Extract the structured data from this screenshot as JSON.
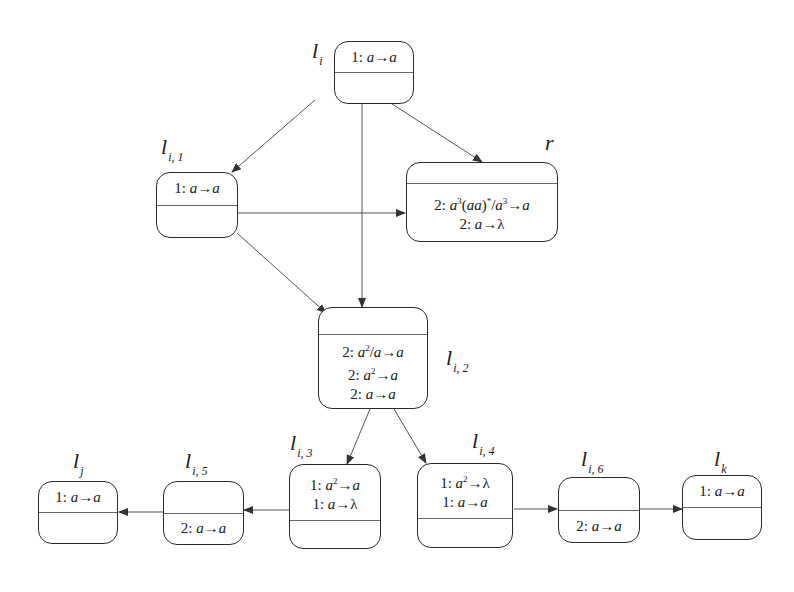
{
  "diagram": {
    "type": "state-transition",
    "nodes": [
      {
        "id": "li",
        "label": "l",
        "sub": "i",
        "top_rules": [
          "1: a→a"
        ],
        "bottom_rules": []
      },
      {
        "id": "li1",
        "label": "l",
        "sub": "i, 1",
        "top_rules": [
          "1: a→a"
        ],
        "bottom_rules": []
      },
      {
        "id": "r",
        "label": "r",
        "sub": "",
        "top_rules": [],
        "bottom_rules": [
          "2: a^3(aa)*/a^3→a",
          "2: a→λ"
        ]
      },
      {
        "id": "li2",
        "label": "l",
        "sub": "i, 2",
        "top_rules": [],
        "bottom_rules": [
          "2: a^2/a→a",
          "2: a^2→a",
          "2: a→a"
        ]
      },
      {
        "id": "li3",
        "label": "l",
        "sub": "i, 3",
        "top_rules": [
          "1: a^2→a",
          "1: a→λ"
        ],
        "bottom_rules": []
      },
      {
        "id": "li4",
        "label": "l",
        "sub": "i, 4",
        "top_rules": [
          "1: a^2→λ",
          "1: a→a"
        ],
        "bottom_rules": []
      },
      {
        "id": "li5",
        "label": "l",
        "sub": "i, 5",
        "top_rules": [],
        "bottom_rules": [
          "2: a→a"
        ]
      },
      {
        "id": "lj",
        "label": "l",
        "sub": "j",
        "top_rules": [
          "1: a→a"
        ],
        "bottom_rules": []
      },
      {
        "id": "li6",
        "label": "l",
        "sub": "i, 6",
        "top_rules": [],
        "bottom_rules": [
          "2: a→a"
        ]
      },
      {
        "id": "lk",
        "label": "l",
        "sub": "k",
        "top_rules": [
          "1: a→a"
        ],
        "bottom_rules": []
      }
    ],
    "edges": [
      {
        "from": "li",
        "to": "li1"
      },
      {
        "from": "li",
        "to": "r"
      },
      {
        "from": "li",
        "to": "li2"
      },
      {
        "from": "li1",
        "to": "r"
      },
      {
        "from": "li1",
        "to": "li2"
      },
      {
        "from": "li2",
        "to": "li3"
      },
      {
        "from": "li2",
        "to": "li4"
      },
      {
        "from": "li3",
        "to": "li5"
      },
      {
        "from": "li5",
        "to": "lj"
      },
      {
        "from": "li4",
        "to": "li6"
      },
      {
        "from": "li6",
        "to": "lk"
      }
    ]
  },
  "labels": {
    "li": {
      "main": "l",
      "sub": "i"
    },
    "li1": {
      "main": "l",
      "sub": "i, 1"
    },
    "r": {
      "main": "r"
    },
    "li2": {
      "main": "l",
      "sub": "i, 2"
    },
    "li3": {
      "main": "l",
      "sub": "i, 3"
    },
    "li4": {
      "main": "l",
      "sub": "i, 4"
    },
    "li5": {
      "main": "l",
      "sub": "i, 5"
    },
    "lj": {
      "main": "l",
      "sub": "j"
    },
    "li6": {
      "main": "l",
      "sub": "i, 6"
    },
    "lk": {
      "main": "l",
      "sub": "k"
    }
  },
  "rules": {
    "li": {
      "r1_prefix": "1: ",
      "r1_a": "a",
      "r1_arrow": "→",
      "r1_b": "a"
    },
    "li1": {
      "r1_prefix": "1: ",
      "r1_a": "a",
      "r1_arrow": "→",
      "r1_b": "a"
    },
    "r": {
      "r1_prefix": "2: ",
      "r1_a": "a",
      "r1_sup1": "3",
      "r1_mid": "(aa)",
      "r1_star": "*",
      "r1_slash": "/",
      "r1_c": "a",
      "r1_sup2": "3",
      "r1_arrow": "→",
      "r1_b": "a",
      "r2_prefix": "2: ",
      "r2_a": "a",
      "r2_arrow": "→",
      "r2_b": "λ"
    },
    "li2": {
      "r1_prefix": "2: ",
      "r1_a": "a",
      "r1_sup": "2",
      "r1_slash": "/",
      "r1_c": "a",
      "r1_arrow": "→",
      "r1_b": "a",
      "r2_prefix": "2: ",
      "r2_a": "a",
      "r2_sup": "2",
      "r2_arrow": "→",
      "r2_b": "a",
      "r3_prefix": "2: ",
      "r3_a": "a",
      "r3_arrow": "→",
      "r3_b": "a"
    },
    "li3": {
      "r1_prefix": "1: ",
      "r1_a": "a",
      "r1_sup": "2",
      "r1_arrow": "→",
      "r1_b": "a",
      "r2_prefix": "1: ",
      "r2_a": "a",
      "r2_arrow": "→",
      "r2_b": "λ"
    },
    "li4": {
      "r1_prefix": "1: ",
      "r1_a": "a",
      "r1_sup": "2",
      "r1_arrow": "→",
      "r1_b": "λ",
      "r2_prefix": "1: ",
      "r2_a": "a",
      "r2_arrow": "→",
      "r2_b": "a"
    },
    "li5": {
      "r1_prefix": "2: ",
      "r1_a": "a",
      "r1_arrow": "→",
      "r1_b": "a"
    },
    "lj": {
      "r1_prefix": "1: ",
      "r1_a": "a",
      "r1_arrow": "→",
      "r1_b": "a"
    },
    "li6": {
      "r1_prefix": "2: ",
      "r1_a": "a",
      "r1_arrow": "→",
      "r1_b": "a"
    },
    "lk": {
      "r1_prefix": "1: ",
      "r1_a": "a",
      "r1_arrow": "→",
      "r1_b": "a"
    }
  },
  "colors": {
    "stroke": "#2a2a2a",
    "divider": "#666666",
    "edge": "#555555",
    "background": "#ffffff"
  }
}
